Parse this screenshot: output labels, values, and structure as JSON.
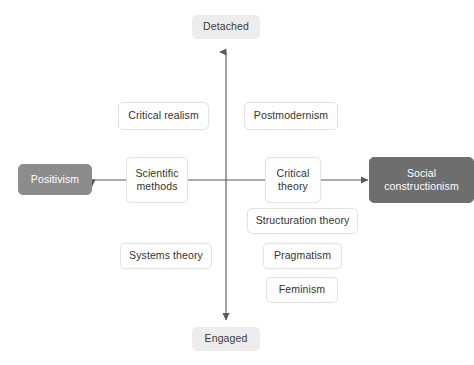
{
  "diagram": {
    "background_color": "#ffffff",
    "axis_color": "#595959",
    "card_fill": "#ffffff",
    "card_border": "#e2e2e2",
    "axis_label_fill": "#ededed",
    "anchor_light_fill": "#8c8c8c",
    "anchor_dark_fill": "#6e6e6e",
    "anchor_text_color": "#ffffff",
    "text_color": "#333333"
  },
  "axes": {
    "vertical": {
      "top_label": "Detached",
      "bottom_label": "Engaged"
    },
    "horizontal": {
      "left_label": "Positivism",
      "right_label": "Social\nconstructionism"
    }
  },
  "nodes": [
    {
      "id": "detached",
      "label": "Detached"
    },
    {
      "id": "engaged",
      "label": "Engaged"
    },
    {
      "id": "positivism",
      "label": "Positivism"
    },
    {
      "id": "social-constructionism",
      "label": "Social\nconstructionism"
    },
    {
      "id": "critical-realism",
      "label": "Critical realism"
    },
    {
      "id": "postmodernism",
      "label": "Postmodernism"
    },
    {
      "id": "scientific-methods",
      "label": "Scientific\nmethods"
    },
    {
      "id": "critical-theory",
      "label": "Critical\ntheory"
    },
    {
      "id": "structuration-theory",
      "label": "Structuration theory"
    },
    {
      "id": "systems-theory",
      "label": "Systems theory"
    },
    {
      "id": "pragmatism",
      "label": "Pragmatism"
    },
    {
      "id": "feminism",
      "label": "Feminism"
    }
  ]
}
